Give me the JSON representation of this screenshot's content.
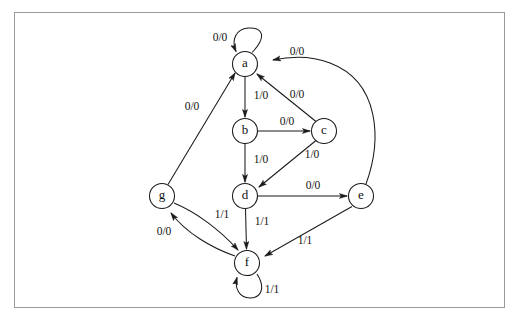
{
  "figure": {
    "type": "state-transition-diagram",
    "caption": "",
    "frame_color": "#9a9a9a",
    "background_color": "#ffffff",
    "stroke_color": "#1a1a1a"
  },
  "diagram": {
    "node_radius": 12.5,
    "nodes": [
      {
        "id": "a",
        "label": "a",
        "x": 245,
        "y": 64
      },
      {
        "id": "b",
        "label": "b",
        "x": 245,
        "y": 131
      },
      {
        "id": "c",
        "label": "c",
        "x": 324,
        "y": 131
      },
      {
        "id": "d",
        "label": "d",
        "x": 245,
        "y": 196
      },
      {
        "id": "e",
        "label": "e",
        "x": 361,
        "y": 196
      },
      {
        "id": "f",
        "label": "f",
        "x": 247,
        "y": 263
      },
      {
        "id": "g",
        "label": "g",
        "x": 162,
        "y": 196
      }
    ],
    "edges": [
      {
        "from": "a",
        "to": "a",
        "label": "0/0",
        "kind": "self-loop",
        "label_x": 220,
        "label_y": 38
      },
      {
        "from": "a",
        "to": "b",
        "label": "1/0",
        "kind": "straight",
        "label_x": 261,
        "label_y": 96
      },
      {
        "from": "b",
        "to": "c",
        "label": "0/0",
        "kind": "straight",
        "label_x": 287,
        "label_y": 122
      },
      {
        "from": "b",
        "to": "d",
        "label": "1/0",
        "kind": "straight",
        "label_x": 261,
        "label_y": 160
      },
      {
        "from": "c",
        "to": "a",
        "label": "0/0",
        "kind": "straight",
        "label_x": 297,
        "label_y": 95
      },
      {
        "from": "c",
        "to": "d",
        "label": "1/0",
        "kind": "straight",
        "label_x": 312,
        "label_y": 155
      },
      {
        "from": "d",
        "to": "e",
        "label": "0/0",
        "kind": "straight",
        "label_x": 313,
        "label_y": 186
      },
      {
        "from": "d",
        "to": "f",
        "label": "1/1",
        "kind": "straight",
        "label_x": 262,
        "label_y": 222
      },
      {
        "from": "e",
        "to": "a",
        "label": "0/0",
        "kind": "curved",
        "label_x": 297,
        "label_y": 52
      },
      {
        "from": "e",
        "to": "f",
        "label": "1/1",
        "kind": "straight",
        "label_x": 305,
        "label_y": 241
      },
      {
        "from": "f",
        "to": "f",
        "label": "1/1",
        "kind": "self-loop",
        "label_x": 272,
        "label_y": 290
      },
      {
        "from": "f",
        "to": "g",
        "label": "0/0",
        "kind": "curved",
        "label_x": 164,
        "label_y": 232
      },
      {
        "from": "g",
        "to": "a",
        "label": "0/0",
        "kind": "straight",
        "label_x": 192,
        "label_y": 107
      },
      {
        "from": "g",
        "to": "f",
        "label": "1/1",
        "kind": "curved",
        "label_x": 222,
        "label_y": 215
      }
    ]
  }
}
